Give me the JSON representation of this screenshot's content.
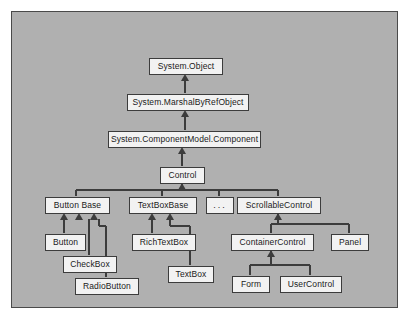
{
  "diagram": {
    "type": "class-inheritance-diagram",
    "colors": {
      "page_background": "#ffffff",
      "canvas_background": "#b0b0b0",
      "canvas_border": "#4a4a4a",
      "node_fill": "#f2f2f2",
      "node_border": "#3c3c3c",
      "edge": "#3c3c3c",
      "text": "#1a1a1a"
    },
    "canvas": {
      "x": 11,
      "y": 11,
      "width": 387,
      "height": 297
    },
    "nodes": [
      {
        "id": "system-object",
        "label": "System.Object",
        "x": 148,
        "y": 57,
        "w": 74,
        "h": 17
      },
      {
        "id": "marshalbyrefobject",
        "label": "System.MarshalByRefObject",
        "x": 126,
        "y": 93,
        "w": 122,
        "h": 17
      },
      {
        "id": "component",
        "label": "System.ComponentModel.Component",
        "x": 107,
        "y": 130,
        "w": 153,
        "h": 17
      },
      {
        "id": "control",
        "label": "Control",
        "x": 159,
        "y": 166,
        "w": 45,
        "h": 17
      },
      {
        "id": "buttonbase",
        "label": "Button Base",
        "x": 44,
        "y": 196,
        "w": 65,
        "h": 17
      },
      {
        "id": "textboxbase",
        "label": "TextBoxBase",
        "x": 128,
        "y": 196,
        "w": 68,
        "h": 17
      },
      {
        "id": "ellipsis",
        "label": "...",
        "x": 205,
        "y": 196,
        "w": 28,
        "h": 17
      },
      {
        "id": "scrollablecontrol",
        "label": "ScrollableControl",
        "x": 236,
        "y": 196,
        "w": 84,
        "h": 17
      },
      {
        "id": "button",
        "label": "Button",
        "x": 44,
        "y": 233,
        "w": 41,
        "h": 17
      },
      {
        "id": "checkbox",
        "label": "CheckBox",
        "x": 62,
        "y": 255,
        "w": 54,
        "h": 17
      },
      {
        "id": "radiobutton",
        "label": "RadioButton",
        "x": 74,
        "y": 277,
        "w": 64,
        "h": 17
      },
      {
        "id": "richtextbox",
        "label": "RichTextBox",
        "x": 131,
        "y": 233,
        "w": 64,
        "h": 17
      },
      {
        "id": "textbox",
        "label": "TextBox",
        "x": 167,
        "y": 265,
        "w": 46,
        "h": 17
      },
      {
        "id": "containercontrol",
        "label": "ContainerControl",
        "x": 230,
        "y": 233,
        "w": 83,
        "h": 17
      },
      {
        "id": "panel",
        "label": "Panel",
        "x": 330,
        "y": 233,
        "w": 38,
        "h": 17
      },
      {
        "id": "form",
        "label": "Form",
        "x": 231,
        "y": 275,
        "w": 38,
        "h": 17
      },
      {
        "id": "usercontrol",
        "label": "UserControl",
        "x": 279,
        "y": 275,
        "w": 62,
        "h": 17
      }
    ],
    "edges": [
      {
        "from": "marshalbyrefobject",
        "to": "system-object",
        "style": "vertical-arrow"
      },
      {
        "from": "component",
        "to": "marshalbyrefobject",
        "style": "vertical-arrow"
      },
      {
        "from": "control",
        "to": "component",
        "style": "vertical-arrow"
      },
      {
        "from": "buttonbase",
        "to": "control",
        "style": "bus-arrow"
      },
      {
        "from": "textboxbase",
        "to": "control",
        "style": "bus-arrow"
      },
      {
        "from": "ellipsis",
        "to": "control",
        "style": "bus-arrow"
      },
      {
        "from": "scrollablecontrol",
        "to": "control",
        "style": "bus-arrow"
      },
      {
        "from": "button",
        "to": "buttonbase",
        "style": "elbow-arrow"
      },
      {
        "from": "checkbox",
        "to": "buttonbase",
        "style": "elbow-arrow"
      },
      {
        "from": "radiobutton",
        "to": "buttonbase",
        "style": "elbow-arrow"
      },
      {
        "from": "richtextbox",
        "to": "textboxbase",
        "style": "elbow-arrow"
      },
      {
        "from": "textbox",
        "to": "textboxbase",
        "style": "elbow-arrow"
      },
      {
        "from": "containercontrol",
        "to": "scrollablecontrol",
        "style": "bus-arrow"
      },
      {
        "from": "panel",
        "to": "scrollablecontrol",
        "style": "bus-arrow"
      },
      {
        "from": "form",
        "to": "containercontrol",
        "style": "bus-arrow"
      },
      {
        "from": "usercontrol",
        "to": "containercontrol",
        "style": "bus-arrow"
      }
    ]
  }
}
